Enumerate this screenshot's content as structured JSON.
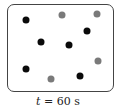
{
  "caption": {
    "var": "t",
    "rest": " = 60 s"
  },
  "colors": {
    "black": "#0a0a0a",
    "gray": "#7a7a7a"
  },
  "particles": [
    {
      "x": 26,
      "y": 20,
      "color": "black"
    },
    {
      "x": 62,
      "y": 15,
      "color": "gray"
    },
    {
      "x": 97,
      "y": 14,
      "color": "gray"
    },
    {
      "x": 87,
      "y": 31,
      "color": "black"
    },
    {
      "x": 41,
      "y": 42,
      "color": "black"
    },
    {
      "x": 69,
      "y": 45,
      "color": "black"
    },
    {
      "x": 98,
      "y": 61,
      "color": "gray"
    },
    {
      "x": 26,
      "y": 69,
      "color": "black"
    },
    {
      "x": 51,
      "y": 79,
      "color": "gray"
    },
    {
      "x": 80,
      "y": 76,
      "color": "black"
    }
  ]
}
